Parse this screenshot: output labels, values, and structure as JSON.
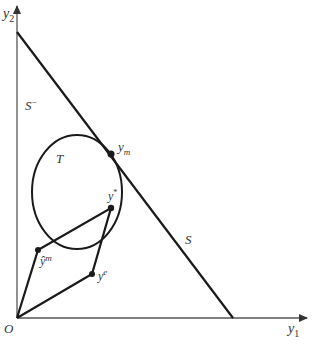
{
  "diagram": {
    "axes": {
      "x_label": "y",
      "x_sub": "1",
      "y_label": "y",
      "y_sub": "2",
      "origin_label": "O"
    },
    "regions": {
      "lower_halfspace": "S",
      "lower_halfspace_sup": "−",
      "line_label": "S",
      "set_label": "T"
    },
    "points": {
      "y_m": {
        "base": "y",
        "sub": "m"
      },
      "y_star": {
        "base": "y",
        "sup": "*"
      },
      "y_hat_m": {
        "base": "ŷ",
        "sup": "m"
      },
      "y_e": {
        "base": "y",
        "sup": "e"
      }
    },
    "colors": {
      "stroke": "#1a1a1a",
      "axis": "#555555",
      "text": "#333333"
    }
  }
}
